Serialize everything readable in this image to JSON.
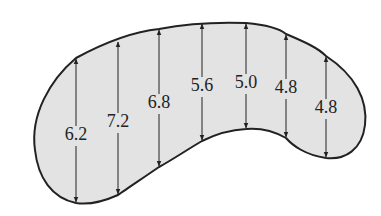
{
  "diagram": {
    "fill_color": "#e3e3e3",
    "stroke_color": "#222222",
    "measurements": [
      {
        "value": "6.2",
        "x": 76,
        "top": 58,
        "bottom": 203,
        "label_y": 140
      },
      {
        "value": "7.2",
        "x": 118,
        "top": 41,
        "bottom": 195,
        "label_y": 127
      },
      {
        "value": "6.8",
        "x": 159,
        "top": 29,
        "bottom": 167,
        "label_y": 108
      },
      {
        "value": "5.6",
        "x": 202,
        "top": 23,
        "bottom": 141,
        "label_y": 91
      },
      {
        "value": "5.0",
        "x": 246,
        "top": 23,
        "bottom": 129,
        "label_y": 88
      },
      {
        "value": "4.8",
        "x": 286,
        "top": 34,
        "bottom": 138,
        "label_y": 93
      },
      {
        "value": "4.8",
        "x": 326,
        "top": 56,
        "bottom": 158,
        "label_y": 113
      }
    ]
  }
}
